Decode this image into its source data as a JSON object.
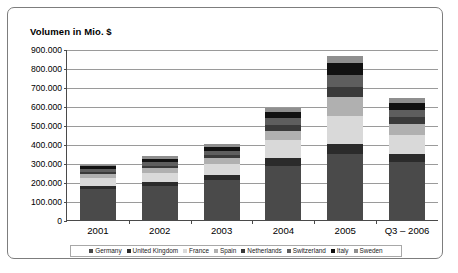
{
  "chart_data": {
    "type": "bar",
    "subtype": "stacked-bar",
    "title": "Volumen in Mio. $",
    "xlabel": "",
    "ylabel": "",
    "ylim": [
      0,
      900000
    ],
    "ytick_step": 100000,
    "ytick_labels": [
      "900.000",
      "800.000",
      "700.000",
      "600.000",
      "500.000",
      "400.000",
      "300.000",
      "200.000",
      "100.000",
      "0"
    ],
    "ytick_values": [
      900000,
      800000,
      700000,
      600000,
      500000,
      400000,
      300000,
      200000,
      100000,
      0
    ],
    "grid": true,
    "grid_axis": "y",
    "legend_position": "bottom",
    "categories": [
      "2001",
      "2002",
      "2003",
      "2004",
      "2005",
      "Q3 – 2006"
    ],
    "series": [
      {
        "name": "Germany",
        "color": "#4a4a4a",
        "values": [
          163000,
          180000,
          210000,
          285000,
          345000,
          305000
        ]
      },
      {
        "name": "United Kingdom",
        "color": "#2b2b2b",
        "values": [
          17000,
          22000,
          27000,
          40000,
          55000,
          40000
        ]
      },
      {
        "name": "France",
        "color": "#d9d9d9",
        "values": [
          42000,
          48000,
          58000,
          95000,
          150000,
          105000
        ]
      },
      {
        "name": "Spain",
        "color": "#b0b0b0",
        "values": [
          20000,
          22000,
          30000,
          50000,
          95000,
          55000
        ]
      },
      {
        "name": "Netherlands",
        "color": "#3a3a3a",
        "values": [
          12000,
          14000,
          18000,
          32000,
          55000,
          35000
        ]
      },
      {
        "name": "Switzerland",
        "color": "#5e5e5e",
        "values": [
          14000,
          17000,
          20000,
          35000,
          65000,
          40000
        ]
      },
      {
        "name": "Italy",
        "color": "#111111",
        "values": [
          14000,
          19000,
          22000,
          32000,
          60000,
          38000
        ]
      },
      {
        "name": "Sweden",
        "color": "#8f8f8f",
        "values": [
          8000,
          13000,
          15000,
          21000,
          40000,
          22000
        ]
      }
    ],
    "totals": [
      290000,
      335000,
      400000,
      590000,
      865000,
      640000
    ]
  }
}
